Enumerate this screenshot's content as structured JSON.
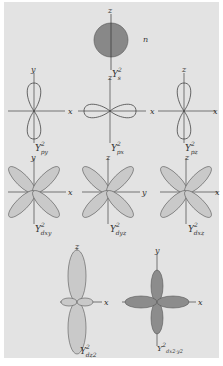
{
  "colors": {
    "background": "#e3e3e3",
    "light_lobe": "#c9c9c9",
    "dark_lobe": "#8c8c8c",
    "s_orbital": "#888888",
    "line": "#444444"
  },
  "orbitals": [
    {
      "name": "s",
      "label": "Y",
      "sup": "2",
      "sub": "s",
      "axes": [
        "z"
      ],
      "side_label": "n"
    },
    {
      "name": "py",
      "label": "Y",
      "sup": "2",
      "sub": "py",
      "axes": [
        "y",
        "x"
      ]
    },
    {
      "name": "px",
      "label": "Y",
      "sup": "2",
      "sub": "px",
      "axes": [
        "z",
        "x"
      ]
    },
    {
      "name": "pz",
      "label": "Y",
      "sup": "2",
      "sub": "pz",
      "axes": [
        "z",
        "x"
      ]
    },
    {
      "name": "dxy",
      "label": "Y",
      "sup": "2",
      "sub": "dxy",
      "axes": [
        "y",
        "x"
      ]
    },
    {
      "name": "dyz",
      "label": "Y",
      "sup": "2",
      "sub": "dyz",
      "axes": [
        "z",
        "y"
      ]
    },
    {
      "name": "dxz",
      "label": "Y",
      "sup": "2",
      "sub": "dxz",
      "axes": [
        "z",
        "x"
      ]
    },
    {
      "name": "dz2",
      "label": "Y",
      "sup": "2",
      "sub": "dz2",
      "axes": [
        "z",
        "x"
      ]
    },
    {
      "name": "dx2-y2",
      "label": "Y",
      "sup": "2",
      "sub": "dx2-y2",
      "axes": [
        "y",
        "x"
      ]
    }
  ]
}
